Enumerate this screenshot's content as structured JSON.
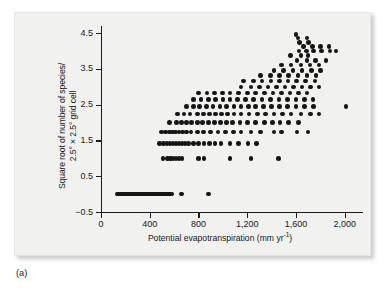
{
  "figure": {
    "panel_label": "(a)",
    "background_color": "#f1f1ef",
    "point_color": "#151515",
    "axis_color": "#1b1b1b"
  },
  "chart_data": {
    "type": "scatter",
    "title": "",
    "xlabel": "Potential evapotranspiration (mm yr",
    "xlabel_sup": "-1",
    "xlabel_close": ")",
    "ylabel_line1": "Square root of number of species/",
    "ylabel_line2": "2.5° × 2.5° grid cell",
    "xlim": [
      0,
      2150
    ],
    "ylim": [
      -0.5,
      4.7
    ],
    "xticks": [
      0,
      400,
      800,
      1200,
      1600,
      2000
    ],
    "xtick_labels": [
      "0",
      "400",
      "800",
      "1,200",
      "1,600",
      "2,000"
    ],
    "yticks": [
      -0.5,
      0.5,
      1.5,
      2.5,
      3.5,
      4.5
    ],
    "ytick_labels": [
      "−0.5",
      "0.5",
      "1.5",
      "2.5",
      "3.5",
      "4.5"
    ],
    "grid": false,
    "legend": null,
    "xunits": "mm yr^-1",
    "yunits": "sqrt(species count)",
    "points": [
      [
        130,
        0
      ],
      [
        142,
        0
      ],
      [
        153,
        0
      ],
      [
        164,
        0
      ],
      [
        175,
        0
      ],
      [
        186,
        0
      ],
      [
        197,
        0
      ],
      [
        208,
        0
      ],
      [
        219,
        0
      ],
      [
        230,
        0
      ],
      [
        241,
        0
      ],
      [
        252,
        0
      ],
      [
        263,
        0
      ],
      [
        274,
        0
      ],
      [
        285,
        0
      ],
      [
        296,
        0
      ],
      [
        307,
        0
      ],
      [
        318,
        0
      ],
      [
        329,
        0
      ],
      [
        340,
        0
      ],
      [
        351,
        0
      ],
      [
        362,
        0
      ],
      [
        373,
        0
      ],
      [
        384,
        0
      ],
      [
        395,
        0
      ],
      [
        406,
        0
      ],
      [
        417,
        0
      ],
      [
        428,
        0
      ],
      [
        439,
        0
      ],
      [
        450,
        0
      ],
      [
        461,
        0
      ],
      [
        472,
        0
      ],
      [
        483,
        0
      ],
      [
        494,
        0
      ],
      [
        505,
        0
      ],
      [
        516,
        0
      ],
      [
        527,
        0
      ],
      [
        538,
        0
      ],
      [
        549,
        0
      ],
      [
        560,
        0
      ],
      [
        571,
        0
      ],
      [
        582,
        0
      ],
      [
        660,
        0
      ],
      [
        880,
        0
      ],
      [
        510,
        1
      ],
      [
        545,
        1
      ],
      [
        570,
        1
      ],
      [
        590,
        1
      ],
      [
        615,
        1
      ],
      [
        640,
        1
      ],
      [
        665,
        1
      ],
      [
        800,
        1
      ],
      [
        845,
        1
      ],
      [
        1060,
        1
      ],
      [
        1230,
        1
      ],
      [
        1455,
        1
      ],
      [
        480,
        1.414
      ],
      [
        515,
        1.414
      ],
      [
        540,
        1.414
      ],
      [
        565,
        1.414
      ],
      [
        590,
        1.414
      ],
      [
        615,
        1.414
      ],
      [
        640,
        1.414
      ],
      [
        665,
        1.414
      ],
      [
        690,
        1.414
      ],
      [
        720,
        1.414
      ],
      [
        760,
        1.414
      ],
      [
        800,
        1.414
      ],
      [
        845,
        1.414
      ],
      [
        890,
        1.414
      ],
      [
        935,
        1.414
      ],
      [
        985,
        1.414
      ],
      [
        1060,
        1.414
      ],
      [
        1130,
        1.414
      ],
      [
        1205,
        1.414
      ],
      [
        1275,
        1.414
      ],
      [
        495,
        1.732
      ],
      [
        530,
        1.732
      ],
      [
        560,
        1.732
      ],
      [
        585,
        1.732
      ],
      [
        610,
        1.732
      ],
      [
        640,
        1.732
      ],
      [
        670,
        1.732
      ],
      [
        700,
        1.732
      ],
      [
        740,
        1.732
      ],
      [
        790,
        1.732
      ],
      [
        840,
        1.732
      ],
      [
        900,
        1.732
      ],
      [
        960,
        1.732
      ],
      [
        1020,
        1.732
      ],
      [
        1085,
        1.732
      ],
      [
        1150,
        1.732
      ],
      [
        1230,
        1.732
      ],
      [
        1310,
        1.732
      ],
      [
        1420,
        1.732
      ],
      [
        1480,
        1.732
      ],
      [
        1610,
        1.732
      ],
      [
        1700,
        1.732
      ],
      [
        560,
        2
      ],
      [
        620,
        2
      ],
      [
        660,
        2
      ],
      [
        700,
        2
      ],
      [
        745,
        2
      ],
      [
        790,
        2
      ],
      [
        835,
        2
      ],
      [
        880,
        2
      ],
      [
        930,
        2
      ],
      [
        980,
        2
      ],
      [
        1030,
        2
      ],
      [
        1080,
        2
      ],
      [
        1140,
        2
      ],
      [
        1200,
        2
      ],
      [
        1270,
        2
      ],
      [
        1340,
        2
      ],
      [
        1405,
        2
      ],
      [
        1470,
        2
      ],
      [
        1540,
        2
      ],
      [
        1620,
        2
      ],
      [
        630,
        2.236
      ],
      [
        680,
        2.236
      ],
      [
        730,
        2.236
      ],
      [
        790,
        2.236
      ],
      [
        840,
        2.236
      ],
      [
        890,
        2.236
      ],
      [
        940,
        2.236
      ],
      [
        990,
        2.236
      ],
      [
        1040,
        2.236
      ],
      [
        1090,
        2.236
      ],
      [
        1150,
        2.236
      ],
      [
        1215,
        2.236
      ],
      [
        1285,
        2.236
      ],
      [
        1350,
        2.236
      ],
      [
        1420,
        2.236
      ],
      [
        1490,
        2.236
      ],
      [
        1560,
        2.236
      ],
      [
        1640,
        2.236
      ],
      [
        1720,
        2.236
      ],
      [
        1790,
        2.236
      ],
      [
        700,
        2.449
      ],
      [
        760,
        2.449
      ],
      [
        810,
        2.449
      ],
      [
        865,
        2.449
      ],
      [
        920,
        2.449
      ],
      [
        975,
        2.449
      ],
      [
        1030,
        2.449
      ],
      [
        1090,
        2.449
      ],
      [
        1150,
        2.449
      ],
      [
        1210,
        2.449
      ],
      [
        1270,
        2.449
      ],
      [
        1335,
        2.449
      ],
      [
        1400,
        2.449
      ],
      [
        1465,
        2.449
      ],
      [
        1530,
        2.449
      ],
      [
        1600,
        2.449
      ],
      [
        1670,
        2.449
      ],
      [
        1745,
        2.449
      ],
      [
        2010,
        2.449
      ],
      [
        760,
        2.646
      ],
      [
        820,
        2.646
      ],
      [
        880,
        2.646
      ],
      [
        940,
        2.646
      ],
      [
        1000,
        2.646
      ],
      [
        1060,
        2.646
      ],
      [
        1120,
        2.646
      ],
      [
        1185,
        2.646
      ],
      [
        1250,
        2.646
      ],
      [
        1320,
        2.646
      ],
      [
        1390,
        2.646
      ],
      [
        1460,
        2.646
      ],
      [
        1530,
        2.646
      ],
      [
        1600,
        2.646
      ],
      [
        1670,
        2.646
      ],
      [
        1740,
        2.646
      ],
      [
        800,
        2.828
      ],
      [
        870,
        2.828
      ],
      [
        930,
        2.828
      ],
      [
        995,
        2.828
      ],
      [
        1060,
        2.828
      ],
      [
        1130,
        2.828
      ],
      [
        1200,
        2.828
      ],
      [
        1270,
        2.828
      ],
      [
        1340,
        2.828
      ],
      [
        1410,
        2.828
      ],
      [
        1480,
        2.828
      ],
      [
        1550,
        2.828
      ],
      [
        1620,
        2.828
      ],
      [
        1690,
        2.828
      ],
      [
        1150,
        3
      ],
      [
        1230,
        3
      ],
      [
        1300,
        3
      ],
      [
        1370,
        3
      ],
      [
        1440,
        3
      ],
      [
        1510,
        3
      ],
      [
        1580,
        3
      ],
      [
        1650,
        3
      ],
      [
        1720,
        3
      ],
      [
        1790,
        3
      ],
      [
        1170,
        3.162
      ],
      [
        1250,
        3.162
      ],
      [
        1320,
        3.162
      ],
      [
        1395,
        3.162
      ],
      [
        1465,
        3.162
      ],
      [
        1535,
        3.162
      ],
      [
        1605,
        3.162
      ],
      [
        1680,
        3.162
      ],
      [
        1755,
        3.162
      ],
      [
        1310,
        3.317
      ],
      [
        1390,
        3.317
      ],
      [
        1465,
        3.317
      ],
      [
        1540,
        3.317
      ],
      [
        1615,
        3.317
      ],
      [
        1690,
        3.317
      ],
      [
        1765,
        3.317
      ],
      [
        1420,
        3.464
      ],
      [
        1500,
        3.464
      ],
      [
        1575,
        3.464
      ],
      [
        1650,
        3.464
      ],
      [
        1725,
        3.464
      ],
      [
        1800,
        3.464
      ],
      [
        1480,
        3.606
      ],
      [
        1560,
        3.606
      ],
      [
        1640,
        3.606
      ],
      [
        1715,
        3.606
      ],
      [
        1790,
        3.606
      ],
      [
        1610,
        3.742
      ],
      [
        1690,
        3.742
      ],
      [
        1760,
        3.742
      ],
      [
        1845,
        3.742
      ],
      [
        1555,
        3.873
      ],
      [
        1640,
        3.873
      ],
      [
        1700,
        3.873
      ],
      [
        1625,
        4.0
      ],
      [
        1685,
        4.0
      ],
      [
        1745,
        4.0
      ],
      [
        1810,
        4.0
      ],
      [
        1880,
        4.0
      ],
      [
        1930,
        4.0
      ],
      [
        1660,
        4.123
      ],
      [
        1735,
        4.123
      ],
      [
        1800,
        4.123
      ],
      [
        1870,
        4.123
      ],
      [
        1630,
        4.243
      ],
      [
        1705,
        4.243
      ],
      [
        1615,
        4.359
      ],
      [
        1690,
        4.359
      ],
      [
        1600,
        4.47
      ]
    ]
  }
}
